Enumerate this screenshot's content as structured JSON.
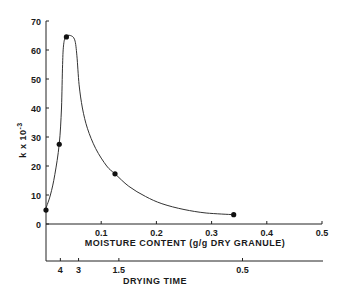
{
  "chart_data": {
    "type": "line",
    "title": "",
    "ylabel": "k x 10",
    "ylabel_exponent": "-3",
    "xlabel": "MOISTURE CONTENT (g/g DRY GRANULE)",
    "x2label": "DRYING TIME",
    "ylim": [
      0,
      70
    ],
    "xlim": [
      0,
      0.5
    ],
    "yticks": [
      0,
      10,
      20,
      30,
      40,
      50,
      60,
      70
    ],
    "xticks": [
      0.1,
      0.2,
      0.3,
      0.4,
      0.5
    ],
    "xtick_labels": [
      "0.1",
      "0.2",
      "0.3",
      "0.4",
      "0.5"
    ],
    "x2ticks": [
      {
        "label": "4",
        "moisture": 0.026
      },
      {
        "label": "3",
        "moisture": 0.059
      },
      {
        "label": "1.5",
        "moisture": 0.132
      },
      {
        "label": "0.5",
        "moisture": 0.356
      }
    ],
    "grid": false,
    "series": [
      {
        "name": "measured",
        "points": [
          {
            "x": 0.0,
            "y": 4.8
          },
          {
            "x": 0.024,
            "y": 27.5
          },
          {
            "x": 0.037,
            "y": 64.5
          },
          {
            "x": 0.125,
            "y": 17.3
          },
          {
            "x": 0.34,
            "y": 3.2
          }
        ]
      },
      {
        "name": "fitted-curve",
        "points": [
          {
            "x": 0.0,
            "y": 5.5
          },
          {
            "x": 0.008,
            "y": 10
          },
          {
            "x": 0.016,
            "y": 17
          },
          {
            "x": 0.024,
            "y": 27.5
          },
          {
            "x": 0.028,
            "y": 40
          },
          {
            "x": 0.03,
            "y": 55
          },
          {
            "x": 0.032,
            "y": 62
          },
          {
            "x": 0.036,
            "y": 64.6
          },
          {
            "x": 0.044,
            "y": 65
          },
          {
            "x": 0.052,
            "y": 63.5
          },
          {
            "x": 0.056,
            "y": 58
          },
          {
            "x": 0.06,
            "y": 48
          },
          {
            "x": 0.066,
            "y": 40
          },
          {
            "x": 0.075,
            "y": 33
          },
          {
            "x": 0.09,
            "y": 26
          },
          {
            "x": 0.11,
            "y": 20
          },
          {
            "x": 0.125,
            "y": 17.3
          },
          {
            "x": 0.15,
            "y": 13
          },
          {
            "x": 0.18,
            "y": 9.5
          },
          {
            "x": 0.21,
            "y": 7
          },
          {
            "x": 0.25,
            "y": 5
          },
          {
            "x": 0.29,
            "y": 3.8
          },
          {
            "x": 0.34,
            "y": 3.2
          }
        ]
      }
    ]
  }
}
